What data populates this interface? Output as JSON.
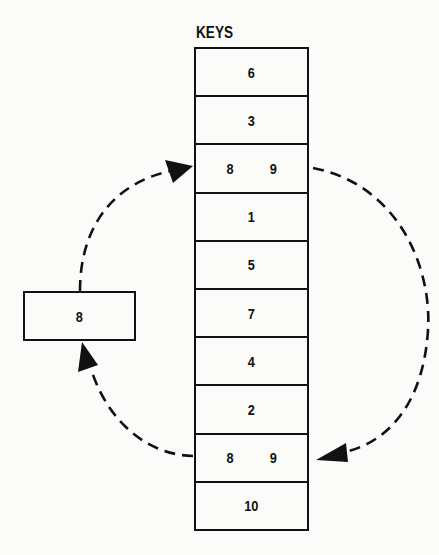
{
  "diagram": {
    "column_label": "KEYS",
    "keys": [
      {
        "value": "6"
      },
      {
        "value": "3"
      },
      {
        "value": "8   9"
      },
      {
        "value": "1"
      },
      {
        "value": "5"
      },
      {
        "value": "7"
      },
      {
        "value": "4"
      },
      {
        "value": "2"
      },
      {
        "value": "8   9"
      },
      {
        "value": "10"
      }
    ],
    "temp_box": {
      "value": "8"
    },
    "arrows": [
      {
        "from": "keys[8]",
        "to": "temp_box",
        "style": "dashed",
        "side": "left-bottom"
      },
      {
        "from": "temp_box",
        "to": "keys[2]",
        "style": "dashed",
        "side": "left-top"
      },
      {
        "from": "keys[2]",
        "to": "keys[8]",
        "style": "dashed",
        "side": "right"
      }
    ],
    "colors": {
      "line": "#111111",
      "background": "#fbfbf9"
    }
  }
}
